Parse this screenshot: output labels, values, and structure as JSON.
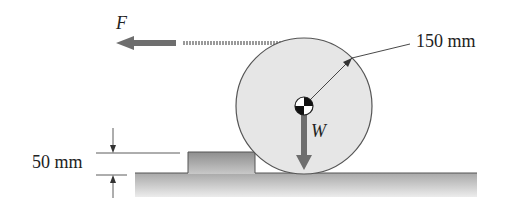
{
  "diagram": {
    "labels": {
      "force": "F",
      "weight": "W",
      "radius": "150 mm",
      "step_height": "50 mm"
    },
    "colors": {
      "wheel_fill": "#e6e6e6",
      "wheel_stroke": "#555555",
      "arrow": "#6e6e6e",
      "ground_top": "#9a9a9a",
      "ground_bottom": "#e8e8e8",
      "dimension_line": "#333333"
    },
    "elements": [
      "wheel",
      "step",
      "ground",
      "cable",
      "pull-force-arrow",
      "weight-arrow",
      "center-of-mass-symbol",
      "radius-dimension",
      "step-height-dimension"
    ]
  }
}
